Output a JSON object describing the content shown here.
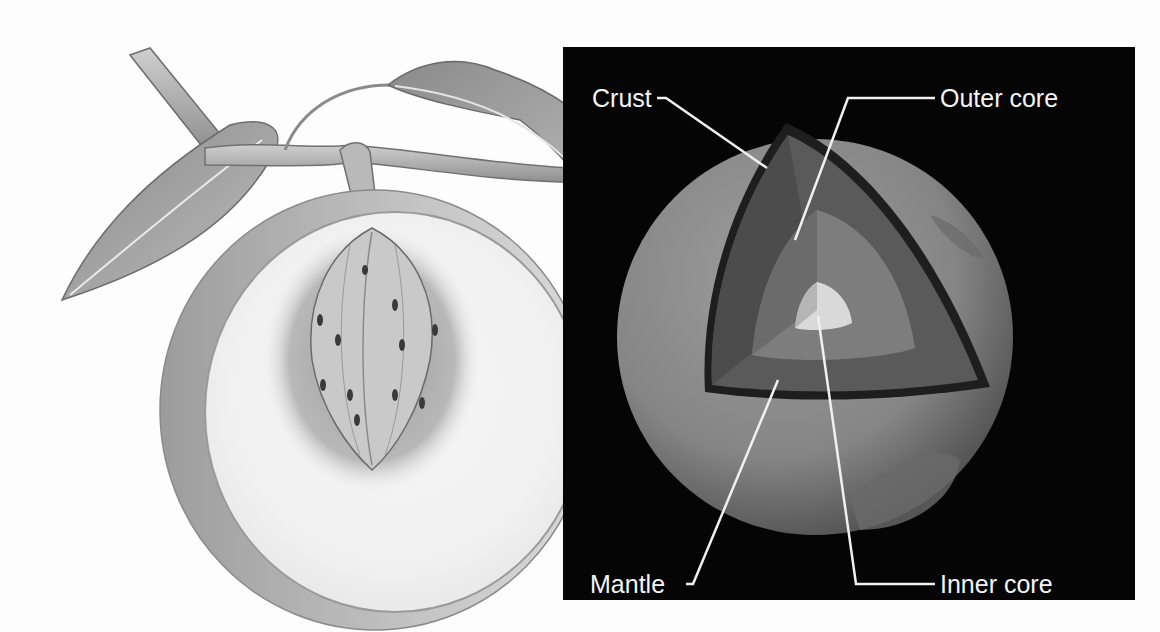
{
  "figure": {
    "left_illustration": {
      "subject": "Peach cut in half showing pit, flesh and skin, on a branch with leaves"
    },
    "right_illustration": {
      "subject": "Cutaway of Earth's layers",
      "background_color": "#050505",
      "labels": {
        "crust": "Crust",
        "outer_core": "Outer core",
        "mantle": "Mantle",
        "inner_core": "Inner core"
      }
    },
    "colors": {
      "label_text": "#f4f4f4",
      "leader_line": "#f0f0f0",
      "page_background": "#fdfdfd"
    }
  }
}
